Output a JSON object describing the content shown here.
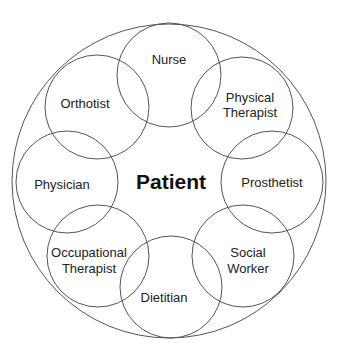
{
  "diagram": {
    "center": {
      "label": "Patient"
    },
    "outer_circle": {
      "cx": 169,
      "cy": 181,
      "r": 156
    },
    "members": [
      {
        "id": "nurse",
        "lines": [
          "Nurse"
        ],
        "cx": 169,
        "cy": 75,
        "r": 52
      },
      {
        "id": "physical-therapist",
        "lines": [
          "Physical",
          "Therapist"
        ],
        "cx": 242,
        "cy": 107,
        "r": 52
      },
      {
        "id": "prosthetist",
        "lines": [
          "Prosthetist"
        ],
        "cx": 272,
        "cy": 183,
        "r": 52
      },
      {
        "id": "social-worker",
        "lines": [
          "Social",
          "Worker"
        ],
        "cx": 243,
        "cy": 257,
        "r": 52
      },
      {
        "id": "dietitian",
        "lines": [
          "Dietitian"
        ],
        "cx": 171,
        "cy": 288,
        "r": 52
      },
      {
        "id": "occupational-therapist",
        "lines": [
          "Occupational",
          "Therapist"
        ],
        "cx": 98,
        "cy": 256,
        "r": 52
      },
      {
        "id": "physician",
        "lines": [
          "Physician"
        ],
        "cx": 67,
        "cy": 183,
        "r": 52
      },
      {
        "id": "orthotist",
        "lines": [
          "Orthotist"
        ],
        "cx": 97,
        "cy": 107,
        "r": 52
      }
    ]
  },
  "labels": {
    "patient": "Patient",
    "nurse": "Nurse",
    "physical_therapist_1": "Physical",
    "physical_therapist_2": "Therapist",
    "prosthetist": "Prosthetist",
    "social_worker_1": "Social",
    "social_worker_2": "Worker",
    "dietitian": "Dietitian",
    "occupational_therapist_1": "Occupational",
    "occupational_therapist_2": "Therapist",
    "physician": "Physician",
    "orthotist": "Orthotist"
  }
}
